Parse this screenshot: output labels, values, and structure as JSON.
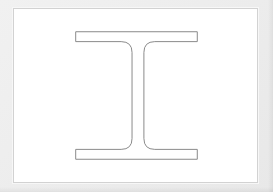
{
  "document": {
    "title": "",
    "canvas_label": "drawing-canvas",
    "background_color": "#ececec",
    "sheet_color": "#ffffff",
    "sheet_border_color": "#d2d2d2"
  },
  "drawing": {
    "name": "I-beam cross-section",
    "shape_type": "i-beam-profile",
    "stroke_color": "#8a8a8a",
    "fill_color": "#ffffff",
    "stroke_width": 1,
    "viewbox": "0 0 245 175",
    "geometry": {
      "top_flange": {
        "left": 62,
        "right": 185,
        "top": 23,
        "bottom": 33,
        "width": 123,
        "thickness": 10
      },
      "bottom_flange": {
        "left": 62,
        "right": 185,
        "top": 142,
        "bottom": 152,
        "width": 123,
        "thickness": 10
      },
      "web": {
        "left": 119,
        "right": 131,
        "top": 33,
        "bottom": 142,
        "thickness": 12,
        "height": 109
      },
      "fillet_radius": 11,
      "outer_corner_radius": 0,
      "center_x": 125,
      "center_y": 87.5,
      "overall_width": 123,
      "overall_height": 129
    },
    "path": "M 62 23 L 185 23 L 185 33 L 142 33 Q 131 33 131 44 L 131 131 Q 131 142 142 142 L 185 142 L 185 152 L 62 152 L 62 142 L 108 142 Q 119 142 119 131 L 119 44 Q 119 33 108 33 L 62 33 Z"
  },
  "labels": {
    "annotations": [],
    "dimensions": []
  }
}
